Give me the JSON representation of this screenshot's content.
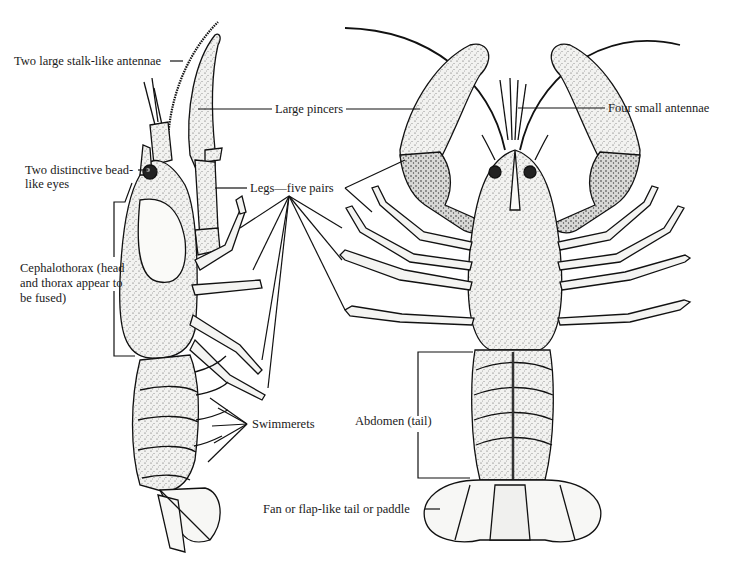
{
  "diagram": {
    "views": [
      {
        "id": "side",
        "name": "side-view"
      },
      {
        "id": "top",
        "name": "top-view"
      }
    ],
    "labels": {
      "antennae_large": "Two large stalk-like antennae",
      "eyes_line1": "Two distinctive bead-",
      "eyes_line2": "like eyes",
      "cephalothorax_line1": "Cephalothorax (head",
      "cephalothorax_line2": "and thorax appear to",
      "cephalothorax_line3": "be fused)",
      "pincers": "Large pincers",
      "legs": "Legs—five pairs",
      "antennae_small": "Four small antennae",
      "swimmerets": "Swimmerets",
      "abdomen": "Abdomen (tail)",
      "tail_fan": "Fan or flap-like tail or paddle"
    },
    "colors": {
      "ink": "#111111",
      "shell": "#f4f4f2",
      "shade": "#8a8a8a",
      "background": "#ffffff"
    }
  }
}
